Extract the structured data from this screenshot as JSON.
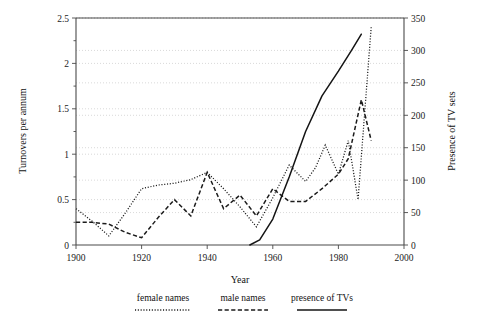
{
  "chart_data": {
    "type": "line",
    "title": "",
    "xlabel": "Year",
    "ylabel": "Turnovers per annum",
    "y2label": "Presence of TV sets",
    "xlim": [
      1900,
      2000
    ],
    "ylim": [
      0,
      2.5
    ],
    "y2lim": [
      0,
      350
    ],
    "grid": true,
    "legend_position": "below",
    "xticks": [
      1900,
      1920,
      1940,
      1960,
      1980,
      2000
    ],
    "xtick_labels": [
      "1900",
      "1920",
      "1940",
      "1960",
      "1980",
      "2000"
    ],
    "yticks": [
      0,
      0.5,
      1,
      1.5,
      2,
      2.5
    ],
    "ytick_labels": [
      "0",
      "0.5",
      "1",
      "1.5",
      "2",
      "2.5"
    ],
    "y2ticks": [
      0,
      50,
      100,
      150,
      200,
      250,
      300,
      350
    ],
    "y2tick_labels": [
      "0",
      "50",
      "100",
      "150",
      "200",
      "250",
      "300",
      "350"
    ],
    "series": [
      {
        "name": "female names",
        "style": "dotted",
        "axis": "left",
        "x": [
          1900,
          1905,
          1910,
          1915,
          1920,
          1925,
          1930,
          1935,
          1940,
          1945,
          1950,
          1955,
          1960,
          1965,
          1970,
          1973,
          1976,
          1980,
          1983,
          1986,
          1990
        ],
        "values": [
          0.4,
          0.26,
          0.1,
          0.35,
          0.62,
          0.66,
          0.68,
          0.72,
          0.8,
          0.62,
          0.42,
          0.2,
          0.52,
          0.88,
          0.7,
          0.85,
          1.1,
          0.78,
          1.15,
          0.5,
          2.4
        ]
      },
      {
        "name": "male names",
        "style": "dashed",
        "axis": "left",
        "x": [
          1900,
          1905,
          1910,
          1915,
          1920,
          1925,
          1930,
          1935,
          1940,
          1945,
          1950,
          1955,
          1960,
          1965,
          1970,
          1975,
          1980,
          1983,
          1987,
          1990
        ],
        "values": [
          0.25,
          0.25,
          0.23,
          0.14,
          0.08,
          0.3,
          0.5,
          0.32,
          0.8,
          0.4,
          0.55,
          0.32,
          0.62,
          0.48,
          0.48,
          0.62,
          0.78,
          0.95,
          1.6,
          1.15
        ]
      },
      {
        "name": "presence of TVs",
        "style": "solid",
        "axis": "right",
        "x": [
          1953,
          1956,
          1960,
          1965,
          1970,
          1975,
          1980,
          1984,
          1987
        ],
        "values": [
          0,
          8,
          40,
          105,
          175,
          230,
          268,
          300,
          325
        ]
      }
    ]
  },
  "legend": {
    "items": [
      {
        "label": "female names",
        "style": "dotted"
      },
      {
        "label": "male names",
        "style": "dashed"
      },
      {
        "label": "presence of TVs",
        "style": "solid"
      }
    ]
  }
}
